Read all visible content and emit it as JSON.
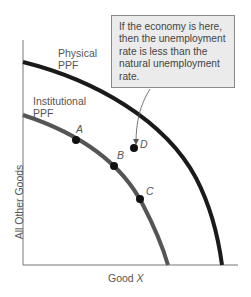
{
  "callout": {
    "lines": [
      "If the economy is here,",
      "then the unemployment",
      "rate is less than the",
      "natural unemployment",
      "rate."
    ]
  },
  "curves": {
    "physical": {
      "line1": "Physical",
      "line2": "PPF",
      "color": "#1a1a1a"
    },
    "institutional": {
      "line1": "Institutional",
      "line2": "PPF",
      "color": "#555555"
    }
  },
  "points": {
    "A": "A",
    "B": "B",
    "C": "C",
    "D": "D"
  },
  "axes": {
    "ylabel": "All Other Goods",
    "xlabel_prefix": "Good ",
    "xlabel_var": "X"
  }
}
